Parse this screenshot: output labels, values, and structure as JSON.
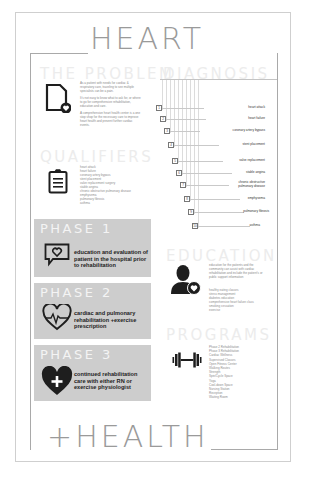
{
  "title_top": "HEART",
  "title_bottom": "+HEALTH",
  "colors": {
    "frame": "#a9a9a9",
    "phase_bg": "#cdcdcd",
    "section_title": "#ececec",
    "icon": "#1e1e1e"
  },
  "problem": {
    "title": "THE PROBLEM",
    "icon": "document-heart-icon",
    "paragraphs": [
      "As a patient with needs for cardiac & respiratory care, traveling to see multiple specialists can be a pain.",
      "It's not easy to know what to ask for, or where to go for comprehensive rehabilitation, education and care.",
      "A comprehensive heart health center is a one stop shop for the necessary care to improve heart health and prevent further cardiac events."
    ]
  },
  "diagnosis": {
    "title": "DIAGNOSIS",
    "items": [
      {
        "num": "1",
        "label": "heart attack"
      },
      {
        "num": "2",
        "label": "heart failure"
      },
      {
        "num": "3",
        "label": "coronary artery bypass"
      },
      {
        "num": "4",
        "label": "stent placement"
      },
      {
        "num": "5",
        "label": "valve replacement"
      },
      {
        "num": "6",
        "label": "stable angina"
      },
      {
        "num": "7",
        "label": "chronic obstructive pulmonary disease"
      },
      {
        "num": "8",
        "label": "emphysema"
      },
      {
        "num": "9",
        "label": "pulmonary fibrosis"
      },
      {
        "num": "10",
        "label": "asthma"
      }
    ]
  },
  "qualifiers": {
    "title": "QUALIFIERS",
    "icon": "clipboard-icon",
    "items": [
      "heart attack",
      "heart failure",
      "coronary artery bypass",
      "stent placement",
      "valve replacement surgery",
      "stable angina",
      "chronic obstructive pulmonary disease",
      "emphysema",
      "pulmonary fibrosis",
      "asthma"
    ]
  },
  "phases": [
    {
      "title": "PHASE 1",
      "icon": "chat-heart-icon",
      "text": "education and evaluation of patient in the hospital prior to rehabilitation"
    },
    {
      "title": "PHASE 2",
      "icon": "heartbeat-icon",
      "text": "cardiac and pulmonary rehabilitation +exercise prescription"
    },
    {
      "title": "PHASE 3",
      "icon": "heart-plus-icon",
      "text": "continued rehabilitation care with either RN or exercise physiologist"
    }
  ],
  "education": {
    "title": "EDUCATION",
    "icon": "person-heart-icon",
    "intro": "education for the patients and the community can assist with cardiac rehabilitation and include the patient's or public support information",
    "items": [
      "healthy eating classes",
      "stress management",
      "diabetes education",
      "comprehensive heart failure class",
      "smoking cessation",
      "exercise"
    ]
  },
  "programs": {
    "title": "PROGRAMS",
    "icon": "dumbbell-icon",
    "items": [
      "Phase 2 Rehabilitation",
      "Phase 3 Rehabilitation",
      "Cardiac Wellness",
      "Supervised Classes",
      "Open Fitness Center",
      "Walking Routes",
      "Strength",
      "Spin/Cycle Space",
      "Yoga",
      "Cool-down Space",
      "Nursing Station",
      "Reception",
      "Waiting Room"
    ]
  }
}
